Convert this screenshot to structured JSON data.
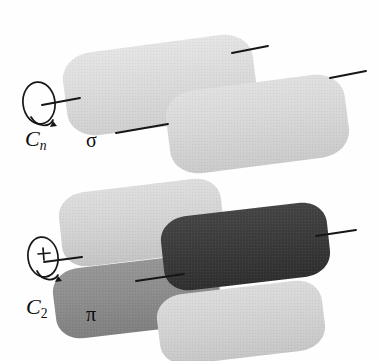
{
  "figure": {
    "kind": "scientific-diagram",
    "background_color": "#ffffff"
  },
  "labels": {
    "cn_axis": {
      "base": "C",
      "subscript": "n",
      "full": "Cn"
    },
    "sigma_orbital": {
      "text": "σ"
    },
    "c2_axis": {
      "base": "C",
      "subscript": "2",
      "full": "C2"
    },
    "pi_orbital": {
      "text": "π"
    }
  },
  "colors": {
    "lobe_very_light": "#e3e3e3",
    "lobe_light": "#d2d2d2",
    "lobe_light_alt": "#dcdcdc",
    "lobe_medium": "#8f8f8f",
    "lobe_medium_dark": "#6f6f6f",
    "lobe_dark": "#3a3a3a",
    "ink": "#141414",
    "paper": "#ffffff"
  },
  "diagrams": [
    {
      "id": "sigma-diagram",
      "name": "sigma-bond-diagram",
      "orbital_label": "σ",
      "axis_label": "Cn",
      "axis_type": "Cn",
      "description": "Two overlapping cylindrical lobes of the same phase forming a sigma bond; rotation about the internuclear axis leaves it unchanged",
      "phase_count": 1,
      "lobes": [
        {
          "name": "sigma-lobe-left",
          "shade": "light",
          "phase": "+"
        },
        {
          "name": "sigma-lobe-right",
          "shade": "light-alt",
          "phase": "+"
        }
      ],
      "axis_marks": 4
    },
    {
      "id": "pi-diagram",
      "name": "pi-bond-diagram",
      "orbital_label": "π",
      "axis_label": "C2",
      "axis_type": "C2",
      "description": "Four lobes in two phases above and below the nodal plane forming a pi bond; only a two-fold rotation restores it",
      "phase_count": 2,
      "lobes": [
        {
          "name": "pi-lobe-upper-left",
          "shade": "light",
          "phase": "+"
        },
        {
          "name": "pi-lobe-upper-right",
          "shade": "dark",
          "phase": "-"
        },
        {
          "name": "pi-lobe-lower-left",
          "shade": "medium",
          "phase": "-"
        },
        {
          "name": "pi-lobe-lower-right",
          "shade": "light",
          "phase": "+"
        }
      ],
      "axis_marks": 3
    }
  ],
  "axis_symbols": [
    {
      "name": "cn-rotation-axis-symbol",
      "for": "sigma-diagram",
      "shape": "ellipse-with-axis-line-and-curved-arrow",
      "has_plus_marker": false,
      "label": "Cn"
    },
    {
      "name": "c2-rotation-axis-symbol",
      "for": "pi-diagram",
      "shape": "ellipse-with-axis-line-plus-marker-and-curved-arrow",
      "has_plus_marker": true,
      "label": "C2"
    }
  ]
}
